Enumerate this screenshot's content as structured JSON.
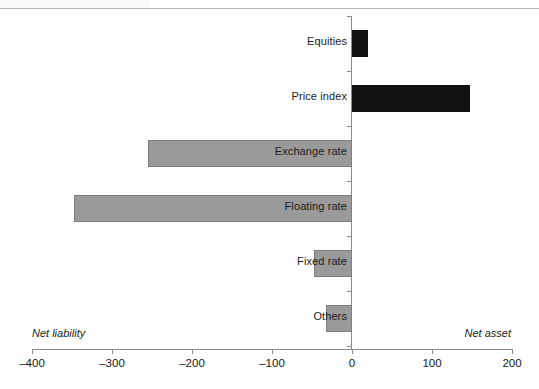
{
  "figure": {
    "background": "#ffffff",
    "neg_bar_color": "#9a9a9a",
    "pos_bar_color": "#111111",
    "axis_color": "#8c8c8c"
  },
  "annotations": {
    "left_label": "Net liability",
    "right_label": "Net asset"
  },
  "chart_data": {
    "type": "bar",
    "orientation": "horizontal",
    "title": "",
    "xlabel": "",
    "ylabel": "",
    "xlim": [
      -400,
      200
    ],
    "xticks": [
      -400,
      -300,
      -200,
      -100,
      0,
      100,
      200
    ],
    "xticklabels": [
      "–400",
      "–300",
      "–200",
      "–100",
      "0",
      "100",
      "200"
    ],
    "grid": false,
    "legend": null,
    "zero_line": 0,
    "categories": [
      "Equities",
      "Price index",
      "Exchange rate",
      "Floating rate",
      "Fixed rate",
      "Others"
    ],
    "values": [
      20,
      148,
      -255,
      -348,
      -48,
      -32
    ],
    "bars": [
      {
        "label": "Equities",
        "value": 20,
        "sign": "positive",
        "color": "#111111"
      },
      {
        "label": "Price index",
        "value": 148,
        "sign": "positive",
        "color": "#111111"
      },
      {
        "label": "Exchange rate",
        "value": -255,
        "sign": "negative",
        "color": "#9a9a9a"
      },
      {
        "label": "Floating rate",
        "value": -348,
        "sign": "negative",
        "color": "#9a9a9a"
      },
      {
        "label": "Fixed rate",
        "value": -48,
        "sign": "negative",
        "color": "#9a9a9a"
      },
      {
        "label": "Others",
        "value": -32,
        "sign": "negative",
        "color": "#9a9a9a"
      }
    ]
  }
}
